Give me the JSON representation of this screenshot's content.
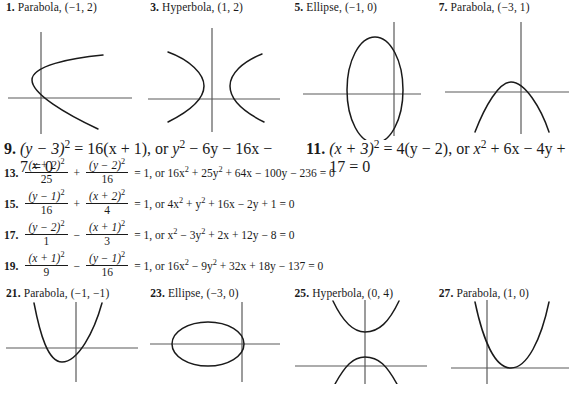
{
  "page": {
    "kind": "textbook-answer-key",
    "ink_color": "#1a1a1a",
    "axis_color": "#5a5a5a",
    "background": "#ffffff"
  },
  "figures_top": [
    {
      "number": "1.",
      "label": "Parabola, (−1, 2)",
      "graph": {
        "type": "parabola",
        "orientation": "opens-right",
        "vertex": [
          -1,
          2
        ],
        "vertex_px": [
          38,
          60
        ],
        "x_axis_y_px": [
          0,
          62,
          130,
          62
        ],
        "y_axis_x_px": [
          42,
          10,
          42,
          118
        ]
      }
    },
    {
      "number": "3.",
      "label": "Hyperbola, (1, 2)",
      "graph": {
        "type": "hyperbola",
        "orientation": "horizontal",
        "center": [
          1,
          2
        ],
        "center_px": [
          58,
          62
        ],
        "x_axis_y_px": [
          0,
          62,
          140,
          62
        ],
        "y_axis_x_px": [
          66,
          10,
          66,
          118
        ]
      }
    },
    {
      "number": "5.",
      "label": "Ellipse, (−1, 0)",
      "graph": {
        "type": "ellipse",
        "orientation": "vertical",
        "center": [
          -1,
          0
        ],
        "center_px": [
          72,
          60
        ],
        "semi_axes_px": [
          25,
          48
        ],
        "x_axis_y_px": [
          12,
          60,
          136,
          60
        ],
        "y_axis_x_px": [
          96,
          6,
          96,
          120
        ]
      }
    },
    {
      "number": "7.",
      "label": "Parabola, (−3, 1)",
      "graph": {
        "type": "parabola",
        "orientation": "opens-down",
        "vertex": [
          -3,
          1
        ],
        "vertex_px": [
          66,
          48
        ],
        "x_axis_y_px": [
          10,
          58,
          138,
          58
        ],
        "y_axis_x_px": [
          82,
          6,
          82,
          120
        ]
      }
    }
  ],
  "equations": [
    {
      "style": "simple",
      "items": [
        {
          "number": "9.",
          "parts": [
            "(y − 3)² = 16(x + 1), or  y² − 6y − 16x − 7 = 0"
          ],
          "text": "(y − 3)2 = 16(x + 1), or y2 − 6y − 16x − 7 = 0"
        },
        {
          "number": "11.",
          "text": "(x + 3)2 = 4(y − 2), or x2 + 6x − 4y + 17 = 0"
        }
      ]
    },
    {
      "style": "fraction",
      "number": "13.",
      "frac1_num": "(x + 2)",
      "frac1_num_sup": "2",
      "frac1_den": "25",
      "operator": "+",
      "frac2_num": "(y − 2)",
      "frac2_num_sup": "2",
      "frac2_den": "16",
      "tail": "= 1, or 16x2 + 25y2 + 64x − 100y − 236 = 0"
    },
    {
      "style": "fraction",
      "number": "15.",
      "frac1_num": "(y − 1)",
      "frac1_num_sup": "2",
      "frac1_den": "16",
      "operator": "+",
      "frac2_num": "(x + 2)",
      "frac2_num_sup": "2",
      "frac2_den": "4",
      "tail": "= 1, or 4x2 + y2 + 16x − 2y + 1 = 0"
    },
    {
      "style": "fraction",
      "number": "17.",
      "frac1_num": "(y − 2)",
      "frac1_num_sup": "2",
      "frac1_den": "1",
      "operator": "−",
      "frac2_num": "(x + 1)",
      "frac2_num_sup": "2",
      "frac2_den": "3",
      "tail": "= 1, or x2 − 3y2 + 2x + 12y − 8 = 0"
    },
    {
      "style": "fraction",
      "number": "19.",
      "frac1_num": "(x + 1)",
      "frac1_num_sup": "2",
      "frac1_den": "9",
      "operator": "−",
      "frac2_num": "(y − 1)",
      "frac2_num_sup": "2",
      "frac2_den": "16",
      "tail": "= 1, or 16x2 − 9y2 + 32x + 18y − 137 = 0"
    }
  ],
  "eq9": {
    "number": "9.",
    "lhs_base": "(y − 3)",
    "lhs_sup": "2",
    "eq1": "= 16(x + 1), or ",
    "t1": "y",
    "t1_sup": "2",
    "t2": " − 6y − 16x − 7 = 0"
  },
  "eq11": {
    "number": "11.",
    "lhs_base": "(x + 3)",
    "lhs_sup": "2",
    "eq1": "= 4(y − 2), or ",
    "t1": "x",
    "t1_sup": "2",
    "t2": " + 6x − 4y + 17 = 0"
  },
  "eq13": {
    "number": "13.",
    "n1": "(x + 2)",
    "n1s": "2",
    "d1": "25",
    "op": "+",
    "n2": "(y − 2)",
    "n2s": "2",
    "d2": "16",
    "t_a": "= 1, or 16x",
    "t_a_s": "2",
    "t_b": " + 25y",
    "t_b_s": "2",
    "t_c": " + 64x − 100y − 236 = 0"
  },
  "eq15": {
    "number": "15.",
    "n1": "(y − 1)",
    "n1s": "2",
    "d1": "16",
    "op": "+",
    "n2": "(x + 2)",
    "n2s": "2",
    "d2": "4",
    "t_a": "= 1, or 4x",
    "t_a_s": "2",
    "t_b": " + y",
    "t_b_s": "2",
    "t_c": " + 16x − 2y + 1 = 0"
  },
  "eq17": {
    "number": "17.",
    "n1": "(y − 2)",
    "n1s": "2",
    "d1": "1",
    "op": "−",
    "n2": "(x + 1)",
    "n2s": "2",
    "d2": "3",
    "t_a": "= 1, or x",
    "t_a_s": "2",
    "t_b": " − 3y",
    "t_b_s": "2",
    "t_c": " + 2x + 12y − 8 = 0"
  },
  "eq19": {
    "number": "19.",
    "n1": "(x + 1)",
    "n1s": "2",
    "d1": "9",
    "op": "−",
    "n2": "(y − 1)",
    "n2s": "2",
    "d2": "16",
    "t_a": "= 1, or 16x",
    "t_a_s": "2",
    "t_b": " − 9y",
    "t_b_s": "2",
    "t_c": " + 32x + 18y − 137 = 0"
  },
  "figures_bottom": [
    {
      "number": "21.",
      "label": "Parabola, (−1, −1)",
      "graph": {
        "type": "parabola",
        "orientation": "opens-up",
        "vertex": [
          -1,
          -1
        ],
        "vertex_px": [
          58,
          62
        ],
        "x_axis_y_px": [
          6,
          48,
          138,
          48
        ],
        "y_axis_x_px": [
          76,
          2,
          76,
          82
        ]
      }
    },
    {
      "number": "23.",
      "label": "Ellipse, (−3, 0)",
      "graph": {
        "type": "ellipse",
        "orientation": "horizontal",
        "center": [
          -3,
          0
        ],
        "center_px": [
          64,
          44
        ],
        "semi_axes_px": [
          36,
          22
        ],
        "x_axis_y_px": [
          6,
          44,
          136,
          44
        ],
        "y_axis_x_px": [
          98,
          2,
          98,
          80
        ]
      }
    },
    {
      "number": "25.",
      "label": "Hyperbola, (0, 4)",
      "graph": {
        "type": "hyperbola",
        "orientation": "vertical",
        "center": [
          0,
          4
        ],
        "center_px": [
          76,
          42
        ],
        "x_axis_y_px": [
          6,
          66,
          138,
          66
        ],
        "y_axis_x_px": [
          76,
          0,
          76,
          84
        ]
      }
    },
    {
      "number": "27.",
      "label": "Parabola, (1, 0)",
      "graph": {
        "type": "parabola",
        "orientation": "opens-up",
        "vertex": [
          1,
          0
        ],
        "vertex_px": [
          80,
          68
        ],
        "x_axis_y_px": [
          18,
          68,
          136,
          68
        ],
        "y_axis_x_px": [
          54,
          0,
          54,
          84
        ]
      }
    }
  ]
}
